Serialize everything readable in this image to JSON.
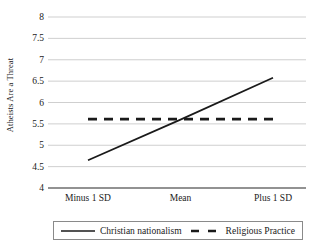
{
  "chart_data": {
    "type": "line",
    "title": "",
    "xlabel": "",
    "ylabel": "Atheists Are a Threat",
    "categories": [
      "Minus 1 SD",
      "Mean",
      "Plus 1 SD"
    ],
    "ylim": [
      4,
      8
    ],
    "yticks": [
      "4",
      "4.5",
      "5",
      "5.5",
      "6",
      "6.5",
      "7",
      "7.5",
      "8"
    ],
    "ytick_values": [
      4,
      4.5,
      5,
      5.5,
      6,
      6.5,
      7,
      7.5,
      8
    ],
    "grid": true,
    "legend_position": "bottom",
    "series": [
      {
        "name": "Christian nationalism",
        "style": "solid",
        "color": "#1a1a1a",
        "values": [
          4.65,
          5.6,
          6.58
        ]
      },
      {
        "name": "Religious Practice",
        "style": "dashed",
        "color": "#1a1a1a",
        "values": [
          5.61,
          5.61,
          5.61
        ]
      }
    ]
  },
  "axis": {
    "y_title": "Atheists Are a Threat"
  },
  "legend": {
    "items": [
      {
        "label": "Christian nationalism"
      },
      {
        "label": "Religious Practice"
      }
    ]
  },
  "colors": {
    "gridline": "#c9c9c9",
    "axis_line": "#6e6e6e",
    "series_line": "#1a1a1a",
    "legend_border": "#8a8a8a",
    "background": "#ffffff"
  }
}
